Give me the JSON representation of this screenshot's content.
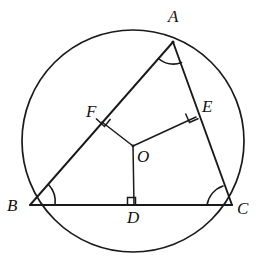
{
  "figure": {
    "background_color": "#ffffff",
    "stroke_color": "#1a1a1a",
    "width": 260,
    "height": 260
  },
  "circle": {
    "name": "circumscribed-circle",
    "center_label": "O",
    "cx": 133,
    "cy": 141,
    "r": 111
  },
  "points": [
    {
      "id": "A",
      "label": "A",
      "x": 173,
      "y": 42,
      "label_x": 168,
      "label_y": 8,
      "role": "triangle-vertex"
    },
    {
      "id": "B",
      "label": "B",
      "x": 30,
      "y": 205,
      "label_x": 7,
      "label_y": 197,
      "role": "triangle-vertex"
    },
    {
      "id": "C",
      "label": "C",
      "x": 232,
      "y": 205,
      "label_x": 237,
      "label_y": 200,
      "role": "triangle-vertex"
    },
    {
      "id": "O",
      "label": "O",
      "x": 133,
      "y": 146,
      "label_x": 137,
      "label_y": 148,
      "role": "circle-center"
    },
    {
      "id": "D",
      "label": "D",
      "x": 134,
      "y": 205,
      "label_x": 127,
      "label_y": 209,
      "role": "foot-on-BC"
    },
    {
      "id": "E",
      "label": "E",
      "x": 196,
      "y": 117,
      "label_x": 202,
      "label_y": 98,
      "role": "foot-on-AC"
    },
    {
      "id": "F",
      "label": "F",
      "x": 102,
      "y": 122,
      "label_x": 86,
      "label_y": 103,
      "role": "foot-on-AB"
    }
  ],
  "segments": [
    {
      "name": "side-AB",
      "from": "A",
      "to": "B"
    },
    {
      "name": "side-AC",
      "from": "A",
      "to": "C"
    },
    {
      "name": "side-BC",
      "from": "B",
      "to": "C"
    },
    {
      "name": "radius-OD",
      "from": "O",
      "to": "D"
    },
    {
      "name": "radius-OE",
      "from": "O",
      "to": "E"
    },
    {
      "name": "radius-OF",
      "from": "O",
      "to": "F"
    }
  ],
  "angle_marks": [
    {
      "name": "angle-arc-A",
      "at": "A",
      "type": "arc"
    },
    {
      "name": "angle-arc-B",
      "at": "B",
      "type": "arc"
    },
    {
      "name": "angle-arc-C",
      "at": "C",
      "type": "arc"
    },
    {
      "name": "right-angle-D",
      "at": "D",
      "type": "right-angle"
    },
    {
      "name": "right-angle-E",
      "at": "E",
      "type": "right-angle"
    },
    {
      "name": "right-angle-F",
      "at": "F",
      "type": "right-angle"
    }
  ]
}
